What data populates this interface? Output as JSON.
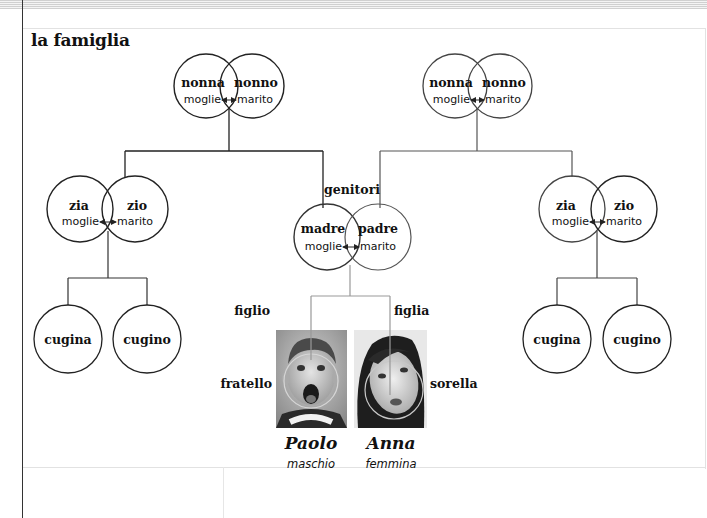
{
  "title": "la famiglia",
  "colors": {
    "line_dark": "#222222",
    "line_light": "#888888",
    "photo_ring": "#bbbbbb"
  },
  "grandparents_left": {
    "left": "nonna",
    "left_role": "moglie",
    "right": "nonno",
    "right_role": "marito"
  },
  "grandparents_right": {
    "left": "nonna",
    "left_role": "moglie",
    "right": "nonno",
    "right_role": "marito"
  },
  "aunt_uncle_left": {
    "left": "zia",
    "left_role": "moglie",
    "right": "zio",
    "right_role": "marito"
  },
  "aunt_uncle_right": {
    "left": "zia",
    "left_role": "moglie",
    "right": "zio",
    "right_role": "marito"
  },
  "parents": {
    "label": "genitori",
    "left": "madre",
    "left_role": "moglie",
    "right": "padre",
    "right_role": "marito"
  },
  "cousins_left": [
    "cugina",
    "cugino"
  ],
  "cousins_right": [
    "cugina",
    "cugino"
  ],
  "children": {
    "son": {
      "relation": "figlio",
      "sibling": "fratello",
      "name": "Paolo",
      "gender": "maschio",
      "image": "boy-photo"
    },
    "daughter": {
      "relation": "figlia",
      "sibling": "sorella",
      "name": "Anna",
      "gender": "femmina",
      "image": "girl-photo"
    }
  }
}
